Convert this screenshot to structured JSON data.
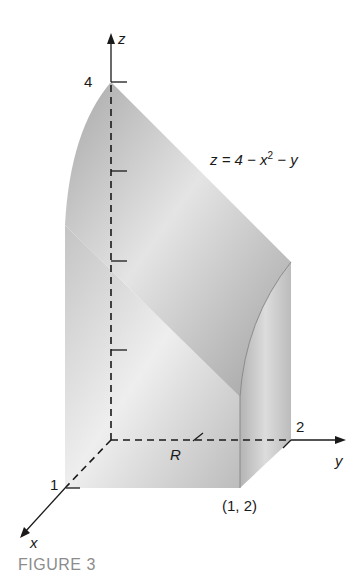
{
  "figure": {
    "caption": "FIGURE 3",
    "equation": "z = 4 − x² − y",
    "equation_parts": {
      "lhs": "z = 4 − x",
      "exp": "2",
      "rhs": " − y"
    },
    "axes": {
      "x": "x",
      "y": "y",
      "z": "z"
    },
    "tick_labels": {
      "z_top": "4",
      "y_end": "2",
      "x_end": "1"
    },
    "region_label": "R",
    "point_label": "(1, 2)",
    "colors": {
      "solid_light": "#e6e6e6",
      "solid_mid": "#bdbdbd",
      "solid_dark": "#9a9a9a",
      "axis": "#1a1a1a",
      "caption": "#8c8c8c"
    }
  }
}
